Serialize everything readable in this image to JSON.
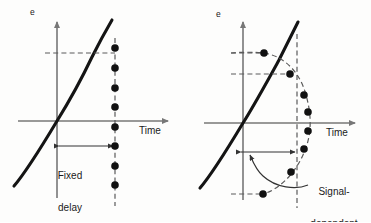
{
  "figure": {
    "background_color": "#fdfdfc",
    "curve_color": "#111111",
    "axis_color": "#777777",
    "dash_color": "#555555",
    "dot_color": "#111111"
  },
  "panels": [
    {
      "id": "left",
      "name": "fixed-delay-panel",
      "axis_y_label": "e",
      "axis_x_label": "Time",
      "callout_lines": [
        "Fixed",
        "delay"
      ],
      "callout_text": "Fixed delay",
      "origin": {
        "x": 57,
        "y": 121
      },
      "sample_line_x": 115,
      "level_dash_y": 53,
      "measure_arrow_y": 146,
      "dot_count": 8,
      "dots": [
        {
          "x": 115,
          "y": 48
        },
        {
          "x": 115,
          "y": 68
        },
        {
          "x": 115,
          "y": 88
        },
        {
          "x": 115,
          "y": 107
        },
        {
          "x": 115,
          "y": 127
        },
        {
          "x": 115,
          "y": 146
        },
        {
          "x": 115,
          "y": 166
        },
        {
          "x": 115,
          "y": 185
        }
      ]
    },
    {
      "id": "right",
      "name": "signal-dependent-panel",
      "axis_y_label": "e",
      "axis_x_label": "Time",
      "callout_lines": [
        "Signal-",
        "dependent",
        "sampling",
        "time"
      ],
      "callout_text": "Signal-dependent sampling time",
      "origin": {
        "x": 243,
        "y": 123
      },
      "sample_line_x": 297,
      "level_dash_y_upper": 53,
      "level_dash_y_lower": 74,
      "measure_arrow_y": 152,
      "dot_count": 8,
      "dots": [
        {
          "x": 264,
          "y": 53
        },
        {
          "x": 290,
          "y": 74
        },
        {
          "x": 304,
          "y": 95
        },
        {
          "x": 308,
          "y": 112
        },
        {
          "x": 308,
          "y": 131
        },
        {
          "x": 304,
          "y": 149
        },
        {
          "x": 291,
          "y": 172
        },
        {
          "x": 263,
          "y": 194
        }
      ]
    }
  ]
}
